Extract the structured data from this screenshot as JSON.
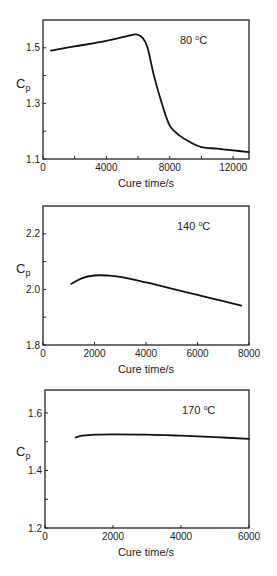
{
  "chart_data": [
    {
      "type": "line",
      "title": "",
      "annotation": "80 °C",
      "annotation_parts": {
        "value": "80 ",
        "deg": "o",
        "unit": "C"
      },
      "xlabel": "Cure time/s",
      "ylabel": "Cp",
      "ylabel_parts": {
        "main": "C",
        "sub": "p"
      },
      "xlim": [
        0,
        13000
      ],
      "ylim": [
        1.1,
        1.6
      ],
      "x_ticks": [
        0,
        4000,
        8000,
        12000
      ],
      "x_minor_ticks": [
        2000,
        6000,
        10000
      ],
      "x_tick_labels": [
        "0",
        "4000",
        "8000",
        "12000"
      ],
      "y_ticks": [
        1.1,
        1.3,
        1.5
      ],
      "y_minor_ticks": [
        1.2,
        1.4
      ],
      "y_tick_labels": [
        "1.1",
        "1.3",
        "1.5"
      ],
      "grid": false,
      "legend": null,
      "series": [
        {
          "name": "80 °C",
          "x": [
            500,
            2000,
            4000,
            5500,
            5900,
            6300,
            6600,
            7000,
            7500,
            8000,
            8600,
            9300,
            10000,
            11000,
            12000,
            13000
          ],
          "y": [
            1.49,
            1.505,
            1.525,
            1.545,
            1.548,
            1.535,
            1.5,
            1.4,
            1.3,
            1.22,
            1.185,
            1.16,
            1.143,
            1.137,
            1.131,
            1.125
          ]
        }
      ]
    },
    {
      "type": "line",
      "title": "",
      "annotation": "140 °C",
      "annotation_parts": {
        "value": "140 ",
        "deg": "o",
        "unit": "C"
      },
      "xlabel": "Cure time/s",
      "ylabel": "Cp",
      "ylabel_parts": {
        "main": "C",
        "sub": "p"
      },
      "xlim": [
        0,
        8000
      ],
      "ylim": [
        1.8,
        2.3
      ],
      "x_ticks": [
        0,
        2000,
        4000,
        6000,
        8000
      ],
      "x_tick_labels": [
        "0",
        "2000",
        "4000",
        "6000",
        "8000"
      ],
      "y_ticks": [
        1.8,
        2.0,
        2.2
      ],
      "y_minor_ticks": [
        1.9,
        2.1
      ],
      "y_tick_labels": [
        "1.8",
        "2.0",
        "2.2"
      ],
      "grid": false,
      "legend": null,
      "series": [
        {
          "name": "140 °C",
          "x": [
            1100,
            1500,
            2000,
            2500,
            3000,
            4000,
            5000,
            6000,
            7000,
            7700
          ],
          "y": [
            2.02,
            2.04,
            2.05,
            2.05,
            2.045,
            2.025,
            2.003,
            1.98,
            1.958,
            1.942
          ]
        }
      ]
    },
    {
      "type": "line",
      "title": "",
      "annotation": "170 °C",
      "annotation_parts": {
        "value": "170 ",
        "deg": "o",
        "unit": "C"
      },
      "xlabel": "Cure time/s",
      "ylabel": "Cp",
      "ylabel_parts": {
        "main": "C",
        "sub": "p"
      },
      "xlim": [
        0,
        6000
      ],
      "ylim": [
        1.2,
        1.68
      ],
      "x_ticks": [
        0,
        2000,
        4000,
        6000
      ],
      "x_tick_labels": [
        "0",
        "2000",
        "4000",
        "6000"
      ],
      "y_ticks": [
        1.2,
        1.4,
        1.6
      ],
      "y_minor_ticks": [
        1.3,
        1.5
      ],
      "y_tick_labels": [
        "1.2",
        "1.4",
        "1.6"
      ],
      "grid": false,
      "legend": null,
      "series": [
        {
          "name": "170 °C",
          "x": [
            900,
            1100,
            1500,
            2000,
            3000,
            4000,
            5000,
            6000
          ],
          "y": [
            1.515,
            1.521,
            1.525,
            1.526,
            1.525,
            1.521,
            1.516,
            1.51
          ]
        }
      ]
    }
  ]
}
